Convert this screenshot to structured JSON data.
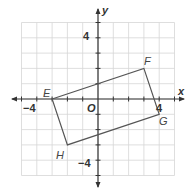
{
  "diagram": {
    "type": "coordinate-plane",
    "axes": {
      "x_label": "x",
      "y_label": "y",
      "origin_label": "O",
      "range": [
        -5,
        5
      ],
      "labeled_ticks": {
        "x_neg": "−4",
        "x_pos": "4",
        "y_pos": "4",
        "y_neg": "−4"
      }
    },
    "quadrilateral": {
      "vertices": [
        {
          "name": "E",
          "x": -3,
          "y": 0
        },
        {
          "name": "F",
          "x": 3,
          "y": 2
        },
        {
          "name": "G",
          "x": 4,
          "y": -1
        },
        {
          "name": "H",
          "x": -2,
          "y": -3
        }
      ]
    },
    "colors": {
      "grid": "#d6d6d6",
      "axis": "#333333",
      "shape": "#555555"
    }
  }
}
